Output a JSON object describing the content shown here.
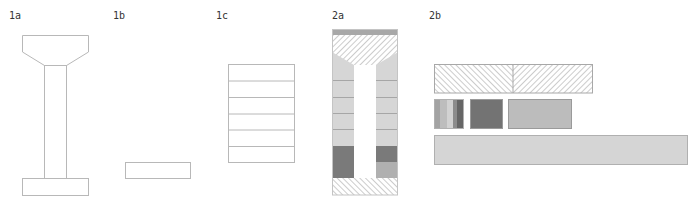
{
  "panels": [
    {
      "id": "1a",
      "label": "1a",
      "x": 9,
      "y": 10
    },
    {
      "id": "1b",
      "label": "1b",
      "x": 113,
      "y": 10
    },
    {
      "id": "1c",
      "label": "1c",
      "x": 216,
      "y": 10
    },
    {
      "id": "2a",
      "label": "2a",
      "x": 332,
      "y": 10
    },
    {
      "id": "2b",
      "label": "2b",
      "x": 429,
      "y": 10
    }
  ],
  "colors": {
    "outline": "#b8b8b8",
    "light_fill": "#d6d6d6",
    "mid_fill": "#b0b0b0",
    "dark_fill": "#7a7a7a",
    "darker_fill": "#5e5e5e",
    "top_band": "#a8a8a8",
    "hatch": "#9a9a9a",
    "pale_fill": "#e2e2e2"
  },
  "panel_1c": {
    "rows": 6
  },
  "panel_2a": {
    "rows": 6,
    "dark_rows_left": [
      4,
      5
    ],
    "dark_rows_right": [
      4
    ]
  },
  "panel_2b": {
    "hatched_bar": {
      "halves": [
        "hatch-backslash",
        "hatch-slash"
      ]
    },
    "stripe_block": {
      "stripes": [
        "#a3a3a3",
        "#bdbdbd",
        "#d2d2d2",
        "#8c8c8c",
        "#666666"
      ]
    },
    "dark_block": {
      "fill": "#737373"
    },
    "grey_block": {
      "fill": "#bcbcbc"
    },
    "long_bar": {
      "fill": "#d5d5d5"
    }
  }
}
